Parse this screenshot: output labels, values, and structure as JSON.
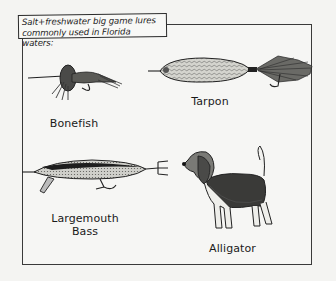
{
  "caption": {
    "line1": "Salt+freshwater big game lures",
    "line2": "commonly used in Florida waters:"
  },
  "items": [
    {
      "label": "Bonefish",
      "depicts": "fly-lure"
    },
    {
      "label": "Tarpon",
      "depicts": "spoon-lure-with-feather-tail"
    },
    {
      "label": "Largemouth",
      "label2": "Bass",
      "depicts": "crankbait-minnow-lure"
    },
    {
      "label": "Alligator",
      "depicts": "beagle-dog"
    }
  ],
  "colors": {
    "ink": "#1a1a1a",
    "paper": "#f6f6f4",
    "lure_body": "#c9c9c4",
    "dark_fill": "#3a3a38"
  }
}
